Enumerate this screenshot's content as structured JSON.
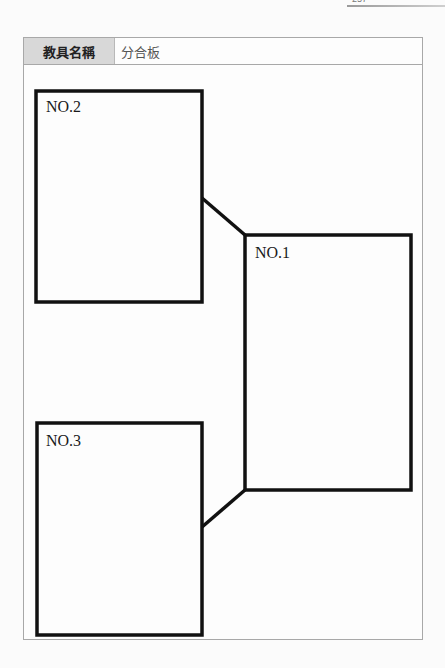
{
  "page": {
    "number": "257"
  },
  "table": {
    "header_label": "教具名稱",
    "header_value": "分合板"
  },
  "diagram": {
    "boxes": [
      {
        "id": "no2",
        "label": "NO.2"
      },
      {
        "id": "no1",
        "label": "NO.1"
      },
      {
        "id": "no3",
        "label": "NO.3"
      }
    ],
    "line_color": "#111111"
  }
}
